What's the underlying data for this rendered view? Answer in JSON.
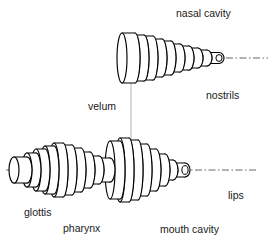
{
  "diagram": {
    "colors": {
      "background": "#ffffff",
      "outline": "#000000",
      "tube_fill": "#ffffff",
      "axis": "#555555",
      "velum_connector": "#b8b8b8",
      "label": "#1a1a1a"
    },
    "labels": [
      {
        "id": "nasal-cavity",
        "text": "nasal cavity",
        "x": 176,
        "y": 14,
        "anchor": "start"
      },
      {
        "id": "nostrils",
        "text": "nostrils",
        "x": 206,
        "y": 96,
        "anchor": "start"
      },
      {
        "id": "velum",
        "text": "velum",
        "x": 88,
        "y": 107,
        "anchor": "start"
      },
      {
        "id": "glottis",
        "text": "glottis",
        "x": 24,
        "y": 213,
        "anchor": "start"
      },
      {
        "id": "pharynx",
        "text": "pharynx",
        "x": 63,
        "y": 229,
        "anchor": "start"
      },
      {
        "id": "mouth-cavity",
        "text": "mouth cavity",
        "x": 160,
        "y": 230,
        "anchor": "start"
      },
      {
        "id": "lips",
        "text": "lips",
        "x": 228,
        "y": 196,
        "anchor": "start"
      }
    ],
    "axes": [
      {
        "id": "nasal-axis",
        "x1": 118,
        "y1": 58,
        "x2": 268,
        "y2": 58
      },
      {
        "id": "oral-axis",
        "x1": 6,
        "y1": 170,
        "x2": 256,
        "y2": 170
      }
    ],
    "velum_connector": {
      "id": "velum-connector",
      "x1": 131,
      "y1": 64,
      "x2": 131,
      "y2": 152
    },
    "nasal_tube": {
      "id": "nasal-tract",
      "axis_y": 58,
      "x_start": 122,
      "ellipse_rx": 5.0,
      "segments": [
        {
          "name": "nasal-seg-1",
          "width": 13,
          "radius": 25
        },
        {
          "name": "nasal-seg-2",
          "width": 9,
          "radius": 23
        },
        {
          "name": "nasal-seg-3",
          "width": 9,
          "radius": 22
        },
        {
          "name": "nasal-seg-4",
          "width": 9,
          "radius": 19
        },
        {
          "name": "nasal-seg-5",
          "width": 9,
          "radius": 17
        },
        {
          "name": "nasal-seg-6",
          "width": 9,
          "radius": 14
        },
        {
          "name": "nasal-seg-7",
          "width": 9,
          "radius": 12
        },
        {
          "name": "nasal-seg-8",
          "width": 9,
          "radius": 10
        },
        {
          "name": "nasal-seg-9",
          "width": 9,
          "radius": 8
        },
        {
          "name": "nasal-seg-10",
          "width": 12,
          "radius": 5.5
        }
      ]
    },
    "oral_tube": {
      "id": "oral-tract",
      "axis_y": 170,
      "x_start": 14,
      "ellipse_rx": 5.0,
      "segments": [
        {
          "name": "glottis-seg-1",
          "width": 13,
          "radius": 13
        },
        {
          "name": "pharynx-seg-1",
          "width": 9,
          "radius": 17
        },
        {
          "name": "pharynx-seg-2",
          "width": 9,
          "radius": 21
        },
        {
          "name": "pharynx-seg-3",
          "width": 9,
          "radius": 24
        },
        {
          "name": "pharynx-seg-4",
          "width": 9,
          "radius": 27
        },
        {
          "name": "pharynx-seg-5",
          "width": 9,
          "radius": 25
        },
        {
          "name": "pharynx-seg-6",
          "width": 9,
          "radius": 22
        },
        {
          "name": "pharynx-seg-7",
          "width": 9,
          "radius": 18
        },
        {
          "name": "velum-waist-1",
          "width": 9,
          "radius": 14
        },
        {
          "name": "velum-waist-2",
          "width": 11,
          "radius": 12
        },
        {
          "name": "mouth-seg-1",
          "width": 10,
          "radius": 29
        },
        {
          "name": "mouth-seg-2",
          "width": 9,
          "radius": 32
        },
        {
          "name": "mouth-seg-3",
          "width": 9,
          "radius": 30
        },
        {
          "name": "mouth-seg-4",
          "width": 9,
          "radius": 26
        },
        {
          "name": "mouth-seg-5",
          "width": 9,
          "radius": 21
        },
        {
          "name": "mouth-seg-6",
          "width": 9,
          "radius": 16
        },
        {
          "name": "lips-seg-1",
          "width": 8,
          "radius": 10
        },
        {
          "name": "lips-seg-2",
          "width": 12,
          "radius": 7
        }
      ]
    }
  }
}
